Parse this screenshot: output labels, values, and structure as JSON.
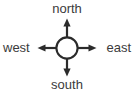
{
  "diagram": {
    "type": "compass-rose",
    "background_color": "#ffffff",
    "stroke_color": "#2b2b2b",
    "text_color": "#3b3b3b",
    "center": {
      "x": 67,
      "y": 48
    },
    "circle": {
      "radius": 11,
      "stroke_width": 2,
      "fill": "none"
    },
    "arrows": [
      {
        "name": "north-arrow",
        "direction": "north",
        "tip": {
          "x": 67,
          "y": 19
        }
      },
      {
        "name": "east-arrow",
        "direction": "east",
        "tip": {
          "x": 96,
          "y": 48
        }
      },
      {
        "name": "south-arrow",
        "direction": "south",
        "tip": {
          "x": 67,
          "y": 76
        }
      },
      {
        "name": "west-arrow",
        "direction": "west",
        "tip": {
          "x": 38,
          "y": 48
        }
      }
    ],
    "labels": {
      "north": "north",
      "east": "east",
      "south": "south",
      "west": "west"
    }
  }
}
